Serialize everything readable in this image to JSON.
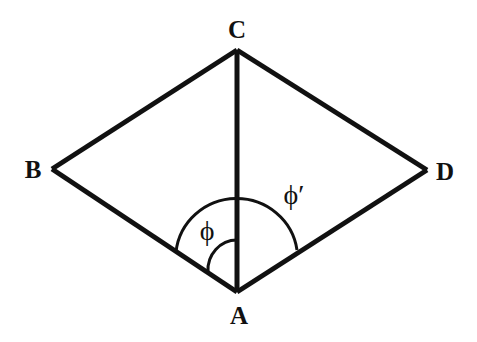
{
  "diagram": {
    "colors": {
      "stroke": "#111111",
      "background": "#ffffff"
    },
    "vertices": {
      "A": {
        "label": "A",
        "x": 237,
        "y": 292
      },
      "B": {
        "label": "B",
        "x": 52,
        "y": 169
      },
      "C": {
        "label": "C",
        "x": 237,
        "y": 50
      },
      "D": {
        "label": "D",
        "x": 427,
        "y": 170
      }
    },
    "edges": [
      {
        "from": "A",
        "to": "B"
      },
      {
        "from": "B",
        "to": "C"
      },
      {
        "from": "C",
        "to": "D"
      },
      {
        "from": "D",
        "to": "A"
      },
      {
        "from": "A",
        "to": "C"
      }
    ],
    "angles": {
      "phi": {
        "label": "ϕ",
        "description": "angle between AB and AC"
      },
      "phi_prime": {
        "label": "ϕ′",
        "description": "angle between AB and AD"
      }
    }
  }
}
